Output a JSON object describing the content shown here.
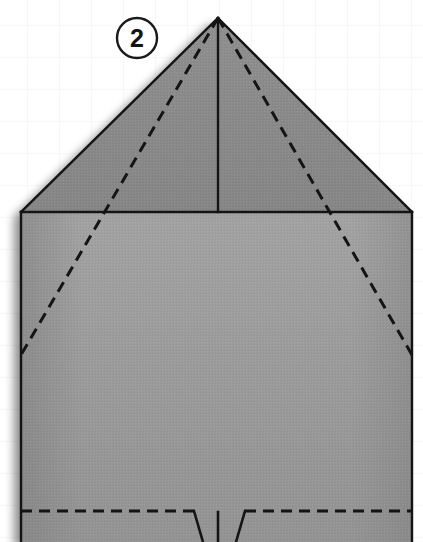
{
  "figure": {
    "type": "origami-fold-diagram",
    "canvas": {
      "width": 423,
      "height": 542
    },
    "background": {
      "color": "#ffffff",
      "grid_color": "#f7f7f7",
      "grid_spacing": 32
    }
  },
  "step_badge": {
    "number": "2",
    "center_x": 137,
    "center_y": 38,
    "radius": 20,
    "stroke_color": "#1a1a1a",
    "text_color": "#141414"
  },
  "paper": {
    "upper_fill": "#8b8b8b",
    "lower_fill": "#9b9b9b",
    "outline_color": "#141414",
    "shadow_color": "#bdbdbd",
    "apex": {
      "x": 218,
      "y": 18
    },
    "left_shoulder": {
      "x": 21,
      "y": 212
    },
    "right_shoulder": {
      "x": 412,
      "y": 212
    },
    "left_edge_x": 21,
    "right_edge_x": 412,
    "baseline_y": 212,
    "bottom_y": 542
  },
  "creases": {
    "solid": [
      {
        "name": "left-roof-edge",
        "from": [
          218,
          18
        ],
        "to": [
          21,
          212
        ]
      },
      {
        "name": "right-roof-edge",
        "from": [
          218,
          18
        ],
        "to": [
          412,
          212
        ]
      },
      {
        "name": "baseline",
        "from": [
          21,
          212
        ],
        "to": [
          412,
          212
        ]
      },
      {
        "name": "center-vertical",
        "from": [
          218,
          18
        ],
        "to": [
          218,
          212
        ]
      },
      {
        "name": "left-body-edge",
        "from": [
          21,
          212
        ],
        "to": [
          21,
          542
        ]
      },
      {
        "name": "right-body-edge",
        "from": [
          412,
          212
        ],
        "to": [
          412,
          542
        ]
      },
      {
        "name": "left-notch-riser",
        "from": [
          194,
          511
        ],
        "to": [
          203,
          542
        ]
      },
      {
        "name": "right-notch-riser",
        "from": [
          245,
          511
        ],
        "to": [
          236,
          542
        ]
      },
      {
        "name": "center-bottom-tick",
        "from": [
          218,
          512
        ],
        "to": [
          218,
          542
        ]
      }
    ],
    "dashed": [
      {
        "name": "left-diagonal-crease",
        "from": [
          218,
          18
        ],
        "to": [
          21,
          355
        ]
      },
      {
        "name": "right-diagonal-crease",
        "from": [
          218,
          18
        ],
        "to": [
          412,
          355
        ]
      },
      {
        "name": "left-bottom-crease",
        "from": [
          21,
          511
        ],
        "to": [
          194,
          511
        ]
      },
      {
        "name": "right-bottom-crease",
        "from": [
          245,
          511
        ],
        "to": [
          412,
          511
        ]
      }
    ],
    "dash_pattern": "11 7",
    "dash_color": "#141414",
    "solid_width": 2.4,
    "dash_width": 3
  }
}
